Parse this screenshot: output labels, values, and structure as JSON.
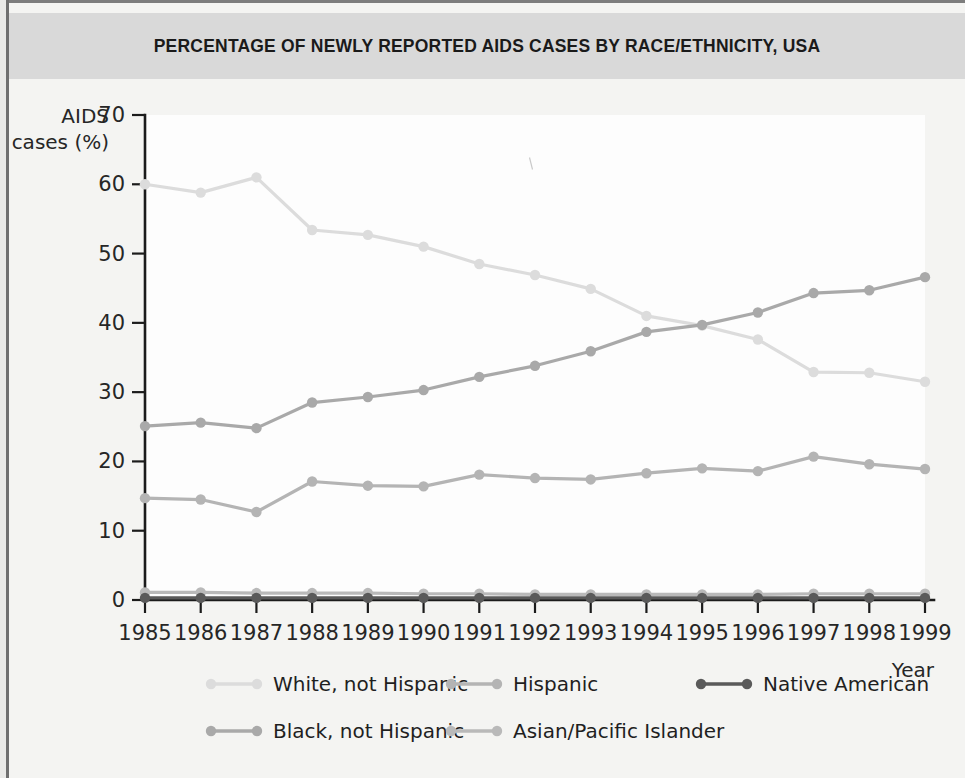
{
  "page": {
    "title": "PERCENTAGE OF NEWLY REPORTED AIDS CASES BY RACE/ETHNICITY, USA",
    "background_color": "#f4f4f2",
    "title_band_color": "#d9d9d9"
  },
  "chart_data": {
    "type": "line",
    "title": "PERCENTAGE OF NEWLY REPORTED AIDS CASES BY RACE/ETHNICITY, USA",
    "xlabel": "Year",
    "ylabel": "AIDS cases (%)",
    "ylabel_line1": "AIDS",
    "ylabel_line2": "cases (%)",
    "x": [
      1985,
      1986,
      1987,
      1988,
      1989,
      1990,
      1991,
      1992,
      1993,
      1994,
      1995,
      1996,
      1997,
      1998,
      1999
    ],
    "categories": [
      "1985",
      "1986",
      "1987",
      "1988",
      "1989",
      "1990",
      "1991",
      "1992",
      "1993",
      "1994",
      "1995",
      "1996",
      "1997",
      "1998",
      "1999"
    ],
    "xlim": [
      1985,
      1999
    ],
    "ylim": [
      0,
      70
    ],
    "yticks": [
      0,
      10,
      20,
      30,
      40,
      50,
      60,
      70
    ],
    "ytick_labels": [
      "0",
      "10",
      "20",
      "30",
      "40",
      "50",
      "60",
      "70"
    ],
    "grid": false,
    "legend_position": "bottom",
    "series": [
      {
        "name": "White, not Hispanic",
        "color": "#dcdcdc",
        "values": [
          60.0,
          58.8,
          61.0,
          53.4,
          52.7,
          51.0,
          48.5,
          46.9,
          44.9,
          41.0,
          39.6,
          37.6,
          32.9,
          32.8,
          31.5
        ]
      },
      {
        "name": "Black, not Hispanic",
        "color": "#a9a9a9",
        "values": [
          25.1,
          25.6,
          24.8,
          28.5,
          29.3,
          30.3,
          32.2,
          33.8,
          35.9,
          38.7,
          39.7,
          41.5,
          44.3,
          44.7,
          46.6
        ]
      },
      {
        "name": "Hispanic",
        "color": "#b4b4b4",
        "values": [
          14.7,
          14.5,
          12.7,
          17.1,
          16.5,
          16.4,
          18.1,
          17.6,
          17.4,
          18.3,
          19.0,
          18.6,
          20.7,
          19.6,
          18.9
        ]
      },
      {
        "name": "Asian/Pacific Islander",
        "color": "#b9b9b9",
        "values": [
          1.1,
          1.1,
          1.0,
          1.0,
          1.0,
          0.9,
          0.9,
          0.8,
          0.8,
          0.8,
          0.8,
          0.8,
          0.9,
          0.9,
          0.9
        ]
      },
      {
        "name": "Native American",
        "color": "#5a5a5a",
        "values": [
          0.3,
          0.3,
          0.3,
          0.3,
          0.3,
          0.3,
          0.3,
          0.3,
          0.3,
          0.3,
          0.3,
          0.3,
          0.3,
          0.3,
          0.3
        ]
      }
    ],
    "legend": [
      {
        "label": "White, not Hispanic",
        "color": "#dcdcdc",
        "row": 0,
        "col": 0
      },
      {
        "label": "Hispanic",
        "color": "#b4b4b4",
        "row": 0,
        "col": 1
      },
      {
        "label": "Native American",
        "color": "#5a5a5a",
        "row": 0,
        "col": 2
      },
      {
        "label": "Black, not Hispanic",
        "color": "#a9a9a9",
        "row": 1,
        "col": 0
      },
      {
        "label": "Asian/Pacific Islander",
        "color": "#b9b9b9",
        "row": 1,
        "col": 1
      }
    ]
  }
}
